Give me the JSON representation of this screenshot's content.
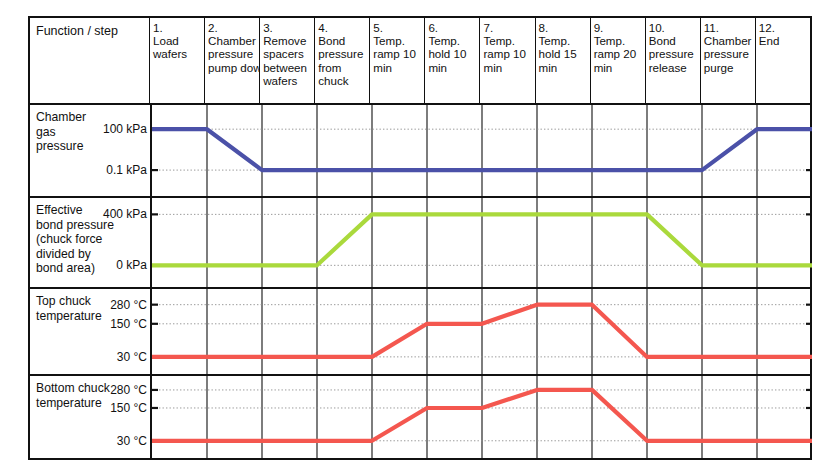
{
  "figure": {
    "title_cell": "Function / step",
    "colors": {
      "chamber_pressure": "#4b51a8",
      "bond_pressure": "#aad93c",
      "temperature": "#f4574f",
      "frame": "#111111",
      "gridline": "#8d8d8d"
    }
  },
  "steps": [
    {
      "num": "1.",
      "label": "Load wafers"
    },
    {
      "num": "2.",
      "label": "Chamber pressure pump down"
    },
    {
      "num": "3.",
      "label": "Remove spacers between wafers"
    },
    {
      "num": "4.",
      "label": "Bond pressure from chuck"
    },
    {
      "num": "5.",
      "label": "Temp. ramp 10 min"
    },
    {
      "num": "6.",
      "label": "Temp. hold 10 min"
    },
    {
      "num": "7.",
      "label": "Temp. ramp 10 min"
    },
    {
      "num": "8.",
      "label": "Temp. hold 15 min"
    },
    {
      "num": "9.",
      "label": "Temp. ramp 20 min"
    },
    {
      "num": "10.",
      "label": "Bond pressure release"
    },
    {
      "num": "11.",
      "label": "Chamber pressure purge"
    },
    {
      "num": "12.",
      "label": "End"
    }
  ],
  "chart_data": {
    "type": "line",
    "xlabel": "Process step",
    "grid": true,
    "legend": "none",
    "x_categories": [
      "1. Load wafers",
      "2. Chamber pressure pump down",
      "3. Remove spacers between wafers",
      "4. Bond pressure from chuck",
      "5. Temp. ramp 10 min",
      "6. Temp. hold 10 min",
      "7. Temp. ramp 10 min",
      "8. Temp. hold 15 min",
      "9. Temp. ramp 20 min",
      "10. Bond pressure release",
      "11. Chamber pressure purge",
      "12. End"
    ],
    "panels": [
      {
        "name": "chamber-gas-pressure",
        "ylabel": "Chamber gas pressure",
        "label_lines": [
          "Chamber",
          "gas",
          "pressure"
        ],
        "color": "#4b51a8",
        "ticks": [
          {
            "label": "100 kPa",
            "value": 100
          },
          {
            "label": "0.1 kPa",
            "value": 0.1
          }
        ],
        "points": [
          {
            "step": 1,
            "at": "start",
            "value": 100
          },
          {
            "step": 2,
            "at": "start",
            "value": 100
          },
          {
            "step": 3,
            "at": "start",
            "value": 0.1
          },
          {
            "step": 11,
            "at": "start",
            "value": 0.1
          },
          {
            "step": 12,
            "at": "start",
            "value": 100
          },
          {
            "step": 12,
            "at": "end",
            "value": 100
          }
        ],
        "description": "Atmospheric 100 kPa through step 1, pumped down during step 2 to 0.1 kPa, held at vacuum through step 10, repressurised during step 11 back to 100 kPa, stays at 100 kPa in step 12."
      },
      {
        "name": "effective-bond-pressure",
        "ylabel": "Effective bond pressure (chuck force divided by bond area)",
        "label_lines": [
          "Effective",
          "bond pressure",
          "(chuck force",
          "divided by",
          "bond area)"
        ],
        "color": "#aad93c",
        "ticks": [
          {
            "label": "400 kPa",
            "value": 400
          },
          {
            "label": "0 kPa",
            "value": 0
          }
        ],
        "points": [
          {
            "step": 1,
            "at": "start",
            "value": 0
          },
          {
            "step": 4,
            "at": "start",
            "value": 0
          },
          {
            "step": 5,
            "at": "start",
            "value": 400
          },
          {
            "step": 10,
            "at": "start",
            "value": 400
          },
          {
            "step": 11,
            "at": "start",
            "value": 0
          },
          {
            "step": 12,
            "at": "end",
            "value": 0
          }
        ],
        "description": "Zero bond pressure through step 3, ramps to 400 kPa during step 4, held at 400 kPa through step 9, released to 0 kPa during step 10, zero for steps 11 and 12."
      },
      {
        "name": "top-chuck-temperature",
        "ylabel": "Top chuck temperature",
        "label_lines": [
          "Top chuck",
          "temperature"
        ],
        "color": "#f4574f",
        "ticks": [
          {
            "label": "280 °C",
            "value": 280
          },
          {
            "label": "150 °C",
            "value": 150
          },
          {
            "label": "30 °C",
            "value": 30
          }
        ],
        "points": [
          {
            "step": 1,
            "at": "start",
            "value": 30
          },
          {
            "step": 5,
            "at": "start",
            "value": 30
          },
          {
            "step": 6,
            "at": "start",
            "value": 150
          },
          {
            "step": 7,
            "at": "start",
            "value": 150
          },
          {
            "step": 8,
            "at": "start",
            "value": 280
          },
          {
            "step": 9,
            "at": "start",
            "value": 280
          },
          {
            "step": 10,
            "at": "start",
            "value": 30
          },
          {
            "step": 12,
            "at": "end",
            "value": 30
          }
        ],
        "description": "30 degC idle through step 4, ramps to 150 degC during step 5, holds 150 degC in step 6, ramps to 280 degC in step 7, holds 280 degC in step 8, cools back to 30 degC during step 9, remains 30 degC for steps 10 to 12."
      },
      {
        "name": "bottom-chuck-temperature",
        "ylabel": "Bottom chuck temperature",
        "label_lines": [
          "Bottom chuck",
          "temperature"
        ],
        "color": "#f4574f",
        "ticks": [
          {
            "label": "280 °C",
            "value": 280
          },
          {
            "label": "150 °C",
            "value": 150
          },
          {
            "label": "30 °C",
            "value": 30
          }
        ],
        "points": [
          {
            "step": 1,
            "at": "start",
            "value": 30
          },
          {
            "step": 5,
            "at": "start",
            "value": 30
          },
          {
            "step": 6,
            "at": "start",
            "value": 150
          },
          {
            "step": 7,
            "at": "start",
            "value": 150
          },
          {
            "step": 8,
            "at": "start",
            "value": 280
          },
          {
            "step": 9,
            "at": "start",
            "value": 280
          },
          {
            "step": 10,
            "at": "start",
            "value": 30
          },
          {
            "step": 12,
            "at": "end",
            "value": 30
          }
        ],
        "description": "Identical profile to the top chuck: 30 degC through step 4, ramp to 150 degC in step 5, hold in step 6, ramp to 280 degC in step 7, hold in step 8, cool to 30 degC during step 9, flat at 30 degC through step 12."
      }
    ]
  }
}
